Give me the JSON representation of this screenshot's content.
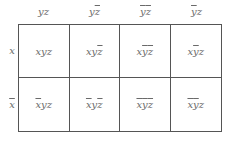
{
  "diagram": {
    "type": "karnaugh-map",
    "columns": [
      {
        "label": "yz",
        "parts": [
          {
            "t": "y",
            "bar": false
          },
          {
            "t": "z",
            "bar": false
          }
        ]
      },
      {
        "label": "yz̄",
        "parts": [
          {
            "t": "y",
            "bar": false
          },
          {
            "t": "z",
            "bar": true
          }
        ]
      },
      {
        "label": "ȳz̄",
        "parts": [
          {
            "t": "y",
            "bar": true
          },
          {
            "t": "z",
            "bar": true
          }
        ]
      },
      {
        "label": "ȳz",
        "parts": [
          {
            "t": "y",
            "bar": true
          },
          {
            "t": "z",
            "bar": false
          }
        ]
      }
    ],
    "rows": [
      {
        "label": "x",
        "parts": [
          {
            "t": "x",
            "bar": false
          }
        ]
      },
      {
        "label": "x̄",
        "parts": [
          {
            "t": "x",
            "bar": true
          }
        ]
      }
    ],
    "cells": [
      [
        "xyz",
        "xyz̄",
        "xȳz̄",
        "xȳz"
      ],
      [
        "x̄yz",
        "x̄yz̄",
        "x̄ȳz̄",
        "x̄ȳz"
      ]
    ],
    "cell_parts": [
      [
        [
          {
            "t": "x",
            "bar": false
          },
          {
            "t": "y",
            "bar": false
          },
          {
            "t": "z",
            "bar": false
          }
        ],
        [
          {
            "t": "x",
            "bar": false
          },
          {
            "t": "y",
            "bar": false
          },
          {
            "t": "z",
            "bar": true
          }
        ],
        [
          {
            "t": "x",
            "bar": false
          },
          {
            "t": "y",
            "bar": true
          },
          {
            "t": "z",
            "bar": true
          }
        ],
        [
          {
            "t": "x",
            "bar": false
          },
          {
            "t": "y",
            "bar": true
          },
          {
            "t": "z",
            "bar": false
          }
        ]
      ],
      [
        [
          {
            "t": "x",
            "bar": true
          },
          {
            "t": "y",
            "bar": false
          },
          {
            "t": "z",
            "bar": false
          }
        ],
        [
          {
            "t": "x",
            "bar": true
          },
          {
            "t": "y",
            "bar": false
          },
          {
            "t": "z",
            "bar": true
          }
        ],
        [
          {
            "t": "x",
            "bar": true
          },
          {
            "t": "y",
            "bar": true
          },
          {
            "t": "z",
            "bar": true
          }
        ],
        [
          {
            "t": "x",
            "bar": true
          },
          {
            "t": "y",
            "bar": true
          },
          {
            "t": "z",
            "bar": false
          }
        ]
      ]
    ],
    "colors": {
      "text": "#6a6a6a",
      "border": "#555555",
      "background": "#ffffff"
    }
  }
}
